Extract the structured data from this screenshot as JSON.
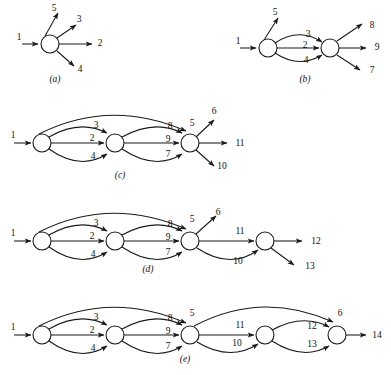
{
  "figure": {
    "title_fragment": "",
    "background": "#ffffff",
    "ink": "#1a1a1a",
    "width": 391,
    "height": 375
  },
  "captions": [
    {
      "id": "cap-a",
      "text": "(a)",
      "x": 55,
      "y": 80
    },
    {
      "id": "cap-b",
      "text": "(b)",
      "x": 305,
      "y": 80
    },
    {
      "id": "cap-c",
      "text": "(c)",
      "x": 120,
      "y": 176
    },
    {
      "id": "cap-d",
      "text": "(d)",
      "x": 148,
      "y": 270
    },
    {
      "id": "cap-e",
      "text": "(e)",
      "x": 185,
      "y": 360
    }
  ],
  "panels": [
    {
      "id": "panel-a",
      "caption": "(a)",
      "nodes": [
        {
          "id": "n1",
          "cx": 50,
          "cy": 44,
          "r": 9
        }
      ],
      "arc_labels": [
        "1",
        "5",
        "3",
        "2",
        "4"
      ],
      "labels": [
        {
          "text": "1",
          "x": 19,
          "y": 38
        },
        {
          "text": "5",
          "x": 54,
          "y": 9
        },
        {
          "text": "3",
          "x": 79,
          "y": 20
        },
        {
          "text": "2",
          "x": 100,
          "y": 44
        },
        {
          "text": "4",
          "x": 80,
          "y": 70
        }
      ]
    },
    {
      "id": "panel-b",
      "caption": "(b)",
      "nodes": [
        {
          "id": "n1",
          "cx": 268,
          "cy": 48,
          "r": 9
        },
        {
          "id": "n2",
          "cx": 330,
          "cy": 48,
          "r": 9
        }
      ],
      "arc_labels": [
        "1",
        "5",
        "3",
        "2",
        "4",
        "8",
        "9",
        "7"
      ],
      "labels": [
        {
          "text": "1",
          "x": 238,
          "y": 42
        },
        {
          "text": "5",
          "x": 275,
          "y": 13
        },
        {
          "text": "3",
          "x": 308,
          "y": 35
        },
        {
          "text": "2",
          "x": 305,
          "y": 46
        },
        {
          "text": "4",
          "x": 306,
          "y": 61
        },
        {
          "text": "8",
          "x": 372,
          "y": 26
        },
        {
          "text": "9",
          "x": 377,
          "y": 48
        },
        {
          "text": "7",
          "x": 372,
          "y": 71
        }
      ]
    },
    {
      "id": "panel-c",
      "caption": "(c)",
      "nodes": [
        {
          "id": "n1",
          "cx": 42,
          "cy": 143,
          "r": 9
        },
        {
          "id": "n2",
          "cx": 115,
          "cy": 143,
          "r": 9
        },
        {
          "id": "n3",
          "cx": 190,
          "cy": 143,
          "r": 9
        }
      ],
      "arc_labels": [
        "1",
        "3",
        "2",
        "4",
        "8",
        "9",
        "7",
        "5",
        "6",
        "11",
        "10"
      ],
      "labels": [
        {
          "text": "1",
          "x": 13,
          "y": 136
        },
        {
          "text": "3",
          "x": 96,
          "y": 126
        },
        {
          "text": "2",
          "x": 92,
          "y": 139
        },
        {
          "text": "4",
          "x": 93,
          "y": 157
        },
        {
          "text": "8",
          "x": 170,
          "y": 127
        },
        {
          "text": "9",
          "x": 168,
          "y": 140
        },
        {
          "text": "7",
          "x": 168,
          "y": 155
        },
        {
          "text": "5",
          "x": 192,
          "y": 124
        },
        {
          "text": "6",
          "x": 214,
          "y": 112
        },
        {
          "text": "11",
          "x": 240,
          "y": 144
        },
        {
          "text": "10",
          "x": 222,
          "y": 167
        }
      ]
    },
    {
      "id": "panel-d",
      "caption": "(d)",
      "nodes": [
        {
          "id": "n1",
          "cx": 42,
          "cy": 241,
          "r": 9
        },
        {
          "id": "n2",
          "cx": 115,
          "cy": 241,
          "r": 9
        },
        {
          "id": "n3",
          "cx": 190,
          "cy": 241,
          "r": 9
        },
        {
          "id": "n4",
          "cx": 265,
          "cy": 241,
          "r": 9
        }
      ],
      "arc_labels": [
        "1",
        "3",
        "2",
        "4",
        "8",
        "9",
        "7",
        "5",
        "6",
        "11",
        "10",
        "12",
        "13"
      ],
      "labels": [
        {
          "text": "1",
          "x": 13,
          "y": 234
        },
        {
          "text": "3",
          "x": 96,
          "y": 224
        },
        {
          "text": "2",
          "x": 92,
          "y": 237
        },
        {
          "text": "4",
          "x": 93,
          "y": 255
        },
        {
          "text": "8",
          "x": 170,
          "y": 225
        },
        {
          "text": "9",
          "x": 168,
          "y": 238
        },
        {
          "text": "7",
          "x": 168,
          "y": 253
        },
        {
          "text": "5",
          "x": 192,
          "y": 220
        },
        {
          "text": "6",
          "x": 218,
          "y": 213
        },
        {
          "text": "11",
          "x": 240,
          "y": 232
        },
        {
          "text": "10",
          "x": 238,
          "y": 262
        },
        {
          "text": "12",
          "x": 316,
          "y": 242
        },
        {
          "text": "13",
          "x": 310,
          "y": 267
        }
      ]
    },
    {
      "id": "panel-e",
      "caption": "(e)",
      "nodes": [
        {
          "id": "n1",
          "cx": 42,
          "cy": 335,
          "r": 9
        },
        {
          "id": "n2",
          "cx": 115,
          "cy": 335,
          "r": 9
        },
        {
          "id": "n3",
          "cx": 190,
          "cy": 335,
          "r": 9
        },
        {
          "id": "n4",
          "cx": 265,
          "cy": 335,
          "r": 9
        },
        {
          "id": "n5",
          "cx": 337,
          "cy": 335,
          "r": 9
        }
      ],
      "arc_labels": [
        "1",
        "3",
        "2",
        "4",
        "8",
        "9",
        "7",
        "5",
        "11",
        "10",
        "12",
        "13",
        "6",
        "14"
      ],
      "labels": [
        {
          "text": "1",
          "x": 13,
          "y": 328
        },
        {
          "text": "3",
          "x": 96,
          "y": 318
        },
        {
          "text": "2",
          "x": 92,
          "y": 331
        },
        {
          "text": "4",
          "x": 93,
          "y": 349
        },
        {
          "text": "8",
          "x": 170,
          "y": 319
        },
        {
          "text": "9",
          "x": 168,
          "y": 332
        },
        {
          "text": "7",
          "x": 168,
          "y": 347
        },
        {
          "text": "5",
          "x": 192,
          "y": 314
        },
        {
          "text": "11",
          "x": 240,
          "y": 326
        },
        {
          "text": "10",
          "x": 237,
          "y": 344
        },
        {
          "text": "12",
          "x": 312,
          "y": 327
        },
        {
          "text": "13",
          "x": 312,
          "y": 345
        },
        {
          "text": "6",
          "x": 340,
          "y": 314
        },
        {
          "text": "14",
          "x": 377,
          "y": 336
        }
      ]
    }
  ],
  "graph_model": {
    "type": "directed-multigraph-sequence",
    "stages": [
      {
        "caption": "(a)",
        "node_count": 1,
        "in_arcs": [
          "1"
        ],
        "out_arcs": [
          "5",
          "3",
          "2",
          "4"
        ]
      },
      {
        "caption": "(b)",
        "node_count": 2,
        "in_arcs": [
          "1"
        ],
        "parallel_arcs": [
          [
            "3",
            "2",
            "4"
          ]
        ],
        "free_out": [
          "5"
        ],
        "out_arcs": [
          "8",
          "9",
          "7"
        ]
      },
      {
        "caption": "(c)",
        "node_count": 3,
        "in_arcs": [
          "1"
        ],
        "parallel_arcs": [
          [
            "3",
            "2",
            "4"
          ],
          [
            "8",
            "9",
            "7"
          ]
        ],
        "bypass_arcs": [
          "5"
        ],
        "out_arcs": [
          "6",
          "11",
          "10"
        ]
      },
      {
        "caption": "(d)",
        "node_count": 4,
        "in_arcs": [
          "1"
        ],
        "parallel_arcs": [
          [
            "3",
            "2",
            "4"
          ],
          [
            "8",
            "9",
            "7"
          ],
          [
            "11",
            "10"
          ]
        ],
        "bypass_arcs": [
          "5"
        ],
        "free_out": [
          "6"
        ],
        "out_arcs": [
          "12",
          "13"
        ]
      },
      {
        "caption": "(e)",
        "node_count": 5,
        "in_arcs": [
          "1"
        ],
        "parallel_arcs": [
          [
            "3",
            "2",
            "4"
          ],
          [
            "8",
            "9",
            "7"
          ],
          [
            "11",
            "10"
          ],
          [
            "12",
            "13"
          ]
        ],
        "bypass_arcs": [
          "5",
          "6"
        ],
        "out_arcs": [
          "14"
        ]
      }
    ]
  }
}
